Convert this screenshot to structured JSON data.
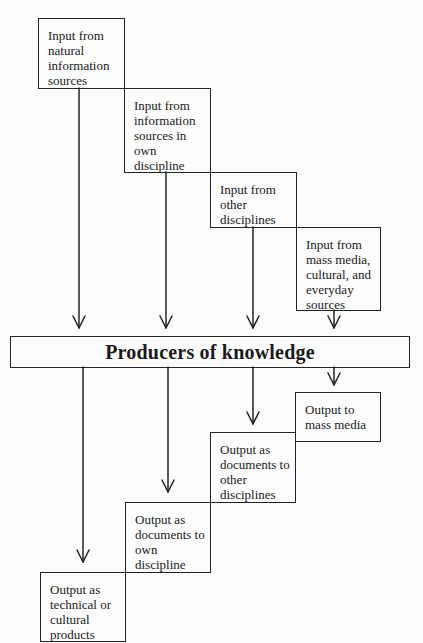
{
  "diagram": {
    "center": {
      "label": "Producers of knowledge"
    },
    "inputs": [
      {
        "label": "Input from\nnatural\ninformation\nsources"
      },
      {
        "label": "Input from\ninformation\nsources in\nown\ndiscipline"
      },
      {
        "label": "Input from\nother\ndisciplines"
      },
      {
        "label": "Input from\nmass media,\ncultural, and\neveryday\nsources"
      }
    ],
    "outputs": [
      {
        "label": "Output to\nmass media"
      },
      {
        "label": "Output as\ndocuments to\nother\ndisciplines"
      },
      {
        "label": "Output as\ndocuments to\nown\ndiscipline"
      },
      {
        "label": "Output as\ntechnical or\ncultural\nproducts"
      }
    ],
    "edges": [
      {
        "from": "inputs.0",
        "to": "center"
      },
      {
        "from": "inputs.1",
        "to": "center"
      },
      {
        "from": "inputs.2",
        "to": "center"
      },
      {
        "from": "inputs.3",
        "to": "center"
      },
      {
        "from": "center",
        "to": "outputs.0"
      },
      {
        "from": "center",
        "to": "outputs.1"
      },
      {
        "from": "center",
        "to": "outputs.2"
      },
      {
        "from": "center",
        "to": "outputs.3"
      }
    ],
    "colors": {
      "line": "#222222",
      "background": "#fdfdfd"
    }
  }
}
